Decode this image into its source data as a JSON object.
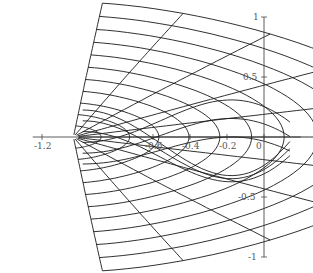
{
  "chart_data": {
    "type": "line",
    "title": "",
    "xlabel": "",
    "ylabel": "",
    "xlim": [
      -1.25,
      0.2
    ],
    "ylim": [
      -1,
      1
    ],
    "grid": false,
    "legend": null,
    "x_ticks": [
      {
        "value": -1.2,
        "label": "-1.2"
      },
      {
        "value": -0.6,
        "label": "-0.6"
      },
      {
        "value": -0.4,
        "label": "-0.4"
      },
      {
        "value": -0.2,
        "label": "-0.2"
      },
      {
        "value": 0,
        "label": "0"
      }
    ],
    "y_ticks": [
      {
        "value": 1,
        "label": "1"
      },
      {
        "value": 0.5,
        "label": "0.5"
      },
      {
        "value": -0.5,
        "label": "-0.5"
      },
      {
        "value": -1,
        "label": "-1"
      }
    ],
    "cluster_point": [
      -1.03,
      0
    ],
    "radial_family_count": 11,
    "oval_family_count": 11,
    "series": [
      {
        "name": "radial curves",
        "values": [
          -1.0,
          -0.8,
          -0.6,
          -0.4,
          -0.2,
          0,
          0.2,
          0.4,
          0.6,
          0.8,
          1.0
        ]
      },
      {
        "name": "oval curves",
        "values": [
          0.1,
          0.2,
          0.3,
          0.4,
          0.5,
          0.6,
          0.7,
          0.8,
          0.9,
          1.0,
          1.1
        ]
      }
    ]
  },
  "axes": {
    "origin_px": [
      264,
      137
    ],
    "x_scale_px": 185,
    "y_scale_px": 120
  },
  "colors": {
    "line": "#1a1a1a",
    "axis": "#333333",
    "label": "#555555",
    "background": "#ffffff"
  }
}
